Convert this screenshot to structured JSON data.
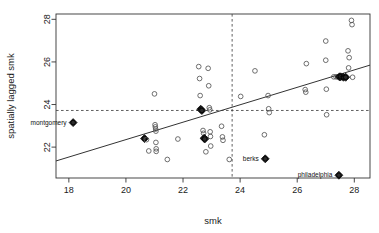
{
  "chart_data": {
    "type": "scatter",
    "title": "",
    "xlabel": "smk",
    "ylabel": "spatially lagged smk",
    "xlim": [
      17.55,
      28.55
    ],
    "ylim": [
      20.55,
      28.25
    ],
    "xticks": [
      18,
      20,
      22,
      24,
      26,
      28
    ],
    "yticks": [
      22,
      24,
      26,
      28
    ],
    "grid": false,
    "legend": null,
    "marker": "open-circle",
    "reference_lines": {
      "vertical_x": 23.72,
      "horizontal_y": 23.72,
      "style": "dashed"
    },
    "fit_line": {
      "type": "linear",
      "x0": 17.55,
      "y0": 21.35,
      "x1": 28.55,
      "y1": 25.85
    },
    "points": [
      {
        "x": 18.15,
        "y": 23.15,
        "highlight": true,
        "label": "montgomery"
      },
      {
        "x": 20.65,
        "y": 22.4,
        "highlight": true
      },
      {
        "x": 20.72,
        "y": 22.35
      },
      {
        "x": 20.8,
        "y": 21.82
      },
      {
        "x": 21.0,
        "y": 24.5
      },
      {
        "x": 21.02,
        "y": 23.05
      },
      {
        "x": 21.03,
        "y": 22.95
      },
      {
        "x": 21.04,
        "y": 22.85
      },
      {
        "x": 21.05,
        "y": 22.75
      },
      {
        "x": 21.05,
        "y": 22.22
      },
      {
        "x": 21.06,
        "y": 21.92
      },
      {
        "x": 21.06,
        "y": 21.8
      },
      {
        "x": 21.45,
        "y": 21.42
      },
      {
        "x": 21.82,
        "y": 22.38
      },
      {
        "x": 22.55,
        "y": 25.78
      },
      {
        "x": 22.58,
        "y": 25.22
      },
      {
        "x": 22.6,
        "y": 24.42
      },
      {
        "x": 22.62,
        "y": 23.78,
        "highlight": true
      },
      {
        "x": 22.66,
        "y": 23.72,
        "highlight": true
      },
      {
        "x": 22.7,
        "y": 22.78
      },
      {
        "x": 22.72,
        "y": 22.65
      },
      {
        "x": 22.74,
        "y": 22.42,
        "highlight": true
      },
      {
        "x": 22.76,
        "y": 22.38,
        "highlight": true
      },
      {
        "x": 22.8,
        "y": 21.78
      },
      {
        "x": 22.88,
        "y": 25.7
      },
      {
        "x": 22.9,
        "y": 24.88
      },
      {
        "x": 22.92,
        "y": 23.85
      },
      {
        "x": 22.94,
        "y": 23.75
      },
      {
        "x": 22.95,
        "y": 22.72
      },
      {
        "x": 22.96,
        "y": 22.5
      },
      {
        "x": 22.97,
        "y": 22.05
      },
      {
        "x": 23.35,
        "y": 22.98
      },
      {
        "x": 23.38,
        "y": 22.48
      },
      {
        "x": 23.4,
        "y": 22.32
      },
      {
        "x": 23.62,
        "y": 21.42
      },
      {
        "x": 24.02,
        "y": 24.38
      },
      {
        "x": 24.52,
        "y": 25.58
      },
      {
        "x": 24.85,
        "y": 22.58
      },
      {
        "x": 24.88,
        "y": 21.45,
        "highlight": true,
        "label": "berks"
      },
      {
        "x": 24.98,
        "y": 24.42
      },
      {
        "x": 25.0,
        "y": 23.8
      },
      {
        "x": 25.02,
        "y": 23.62
      },
      {
        "x": 26.28,
        "y": 24.7
      },
      {
        "x": 26.3,
        "y": 24.58
      },
      {
        "x": 26.32,
        "y": 25.92
      },
      {
        "x": 27.0,
        "y": 26.98
      },
      {
        "x": 27.0,
        "y": 26.08
      },
      {
        "x": 27.02,
        "y": 24.72
      },
      {
        "x": 27.03,
        "y": 23.52
      },
      {
        "x": 27.28,
        "y": 25.3
      },
      {
        "x": 27.36,
        "y": 25.3
      },
      {
        "x": 27.42,
        "y": 25.3
      },
      {
        "x": 27.48,
        "y": 25.3,
        "highlight": true
      },
      {
        "x": 27.52,
        "y": 25.3,
        "highlight": true
      },
      {
        "x": 27.46,
        "y": 20.68,
        "highlight": true,
        "label": "philadelphia"
      },
      {
        "x": 27.62,
        "y": 25.28,
        "highlight": true
      },
      {
        "x": 27.7,
        "y": 25.28,
        "highlight": true
      },
      {
        "x": 27.78,
        "y": 26.52
      },
      {
        "x": 27.8,
        "y": 25.72
      },
      {
        "x": 27.82,
        "y": 26.2
      },
      {
        "x": 27.9,
        "y": 27.95
      },
      {
        "x": 27.92,
        "y": 27.75
      },
      {
        "x": 27.94,
        "y": 25.28
      }
    ],
    "annotations": [
      {
        "text": "montgomery",
        "x": 18.15,
        "y": 23.15,
        "anchor": "right"
      },
      {
        "text": "berks",
        "x": 24.88,
        "y": 21.45,
        "anchor": "right"
      },
      {
        "text": "philadelphia",
        "x": 27.46,
        "y": 20.68,
        "anchor": "right"
      }
    ]
  },
  "axes": {
    "x_title": "smk",
    "y_title": "spatially lagged smk",
    "x_tick_labels": [
      "18",
      "20",
      "22",
      "24",
      "26",
      "28"
    ],
    "y_tick_labels": [
      "22",
      "24",
      "26",
      "28"
    ]
  },
  "colors": {
    "background": "#ffffff",
    "axis": "#333333",
    "point": "#555555",
    "highlight": "#000000",
    "fit_line": "#333333",
    "dashed": "#444444",
    "text": "#1a1a1a"
  }
}
